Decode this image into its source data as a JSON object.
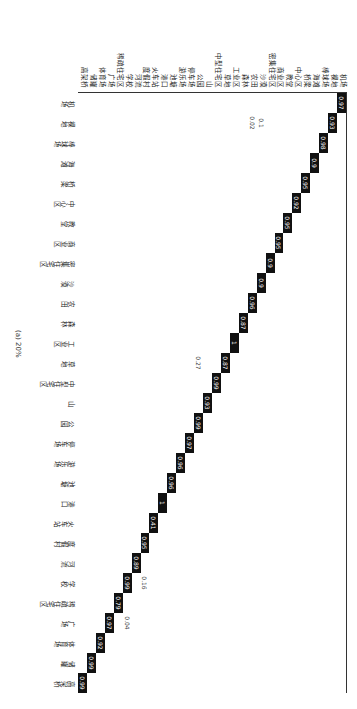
{
  "chart_data": {
    "type": "heatmap",
    "title": "",
    "caption": "(a) 20%",
    "classes": [
      "机场",
      "裸地",
      "棒球场",
      "海滩",
      "桥梁",
      "中心区",
      "教堂",
      "商业区",
      "密集住宅区",
      "沙漠",
      "农田",
      "森林",
      "工业区",
      "草地",
      "中型住宅区",
      "山",
      "公园",
      "停车场",
      "游乐场",
      "池塘",
      "港口",
      "火车站",
      "度假村",
      "河流",
      "学校",
      "稀疏住宅区",
      "广场",
      "体育场",
      "储罐",
      "高架桥"
    ],
    "diagonal": [
      0.97,
      0.93,
      0.98,
      0.9,
      0.95,
      0.92,
      0.95,
      0.95,
      0.9,
      0.9,
      0.96,
      0.87,
      1,
      0.87,
      0.99,
      0.93,
      0.99,
      0.97,
      0.96,
      0.96,
      1,
      0.41,
      0.95,
      0.89,
      0.99,
      0.79,
      0.97,
      0.92,
      0.99,
      0.99
    ],
    "off_diagonal_examples": [
      {
        "row": "沙漠",
        "col": "裸地",
        "value": 0.1
      },
      {
        "row": "农田",
        "col": "裸地",
        "value": 0.02
      },
      {
        "row": "公园",
        "col": "草地",
        "value": 0.27
      },
      {
        "row": "度假村",
        "col": "学校",
        "value": 0.16
      },
      {
        "row": "学校",
        "col": "广场",
        "value": 0.04
      }
    ]
  }
}
